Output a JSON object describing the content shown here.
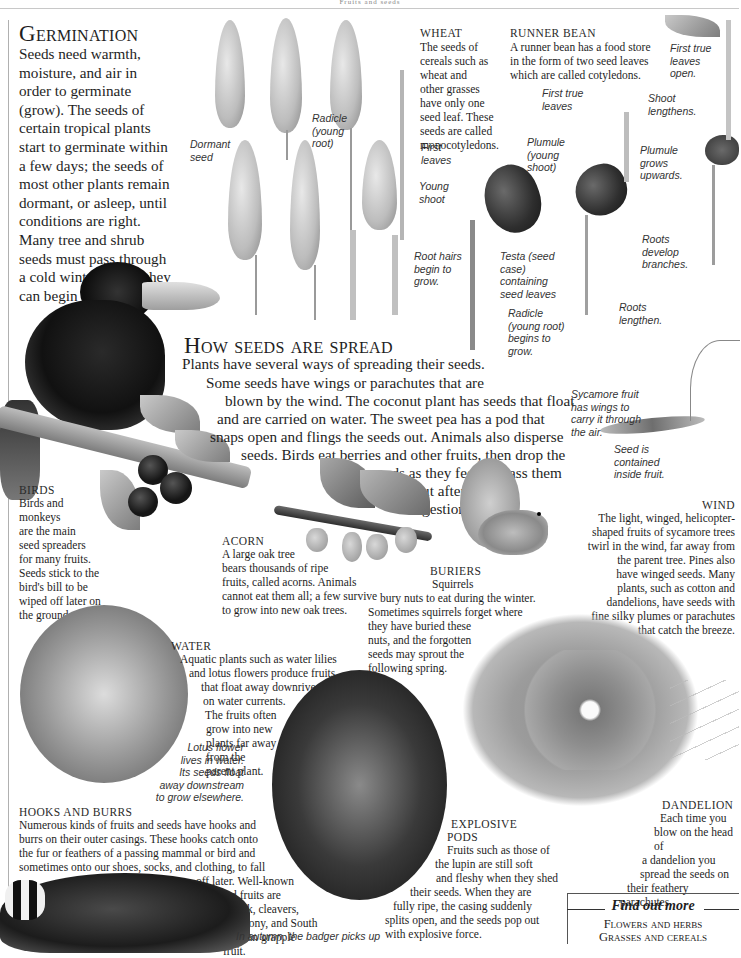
{
  "page": {
    "running_head": "Fruits and seeds"
  },
  "germination": {
    "heading": "Germination",
    "lines": [
      "Seeds need warmth,",
      "moisture, and air in",
      "order to germinate",
      "(grow). The seeds of",
      "certain tropical plants",
      "start to germinate within",
      "a few days; the seeds of",
      "most other plants remain",
      "dormant, or asleep, until",
      "conditions are right.",
      "Many tree and shrub",
      "seeds must pass through",
      "a cold winter before they",
      "can begin to grow."
    ]
  },
  "wheat": {
    "heading": "WHEAT",
    "lines": [
      "The seeds of",
      "cereals such as",
      "wheat and",
      "other grasses",
      "have only one",
      "seed leaf. These",
      "seeds are called",
      "monocotyledons."
    ],
    "labels": {
      "dormant_seed": [
        "Dormant",
        "seed"
      ],
      "radicle": [
        "Radicle",
        "(young",
        "root)"
      ],
      "first_leaves": [
        "First",
        "leaves"
      ],
      "young_shoot": [
        "Young",
        "shoot"
      ],
      "root_hairs": [
        "Root hairs",
        "begin to",
        "grow."
      ]
    }
  },
  "runner_bean": {
    "heading": "RUNNER BEAN",
    "lines": [
      "A runner bean has a food store",
      "in the form of two seed leaves",
      "which are called cotyledons."
    ],
    "labels": {
      "first_true_leaves_open": [
        "First true",
        "leaves",
        "open."
      ],
      "first_true_leaves": [
        "First true",
        "leaves"
      ],
      "shoot_lengthens": [
        "Shoot",
        "lengthens."
      ],
      "plumule": [
        "Plumule",
        "(young",
        "shoot)"
      ],
      "plumule_grows": [
        "Plumule",
        "grows",
        "upwards."
      ],
      "roots_develop": [
        "Roots",
        "develop",
        "branches."
      ],
      "testa": [
        "Testa (seed",
        "case)",
        "containing",
        "seed leaves"
      ],
      "radicle": [
        "Radicle",
        "(young root)",
        "begins to",
        "grow."
      ],
      "roots_lengthen": [
        "Roots",
        "lengthen."
      ]
    }
  },
  "how_spread": {
    "heading": "How seeds are spread",
    "lines": [
      "Plants have several ways of spreading their seeds.",
      "Some seeds have wings or parachutes that are",
      "blown by the wind. The coconut plant has seeds that float",
      "and are carried on water. The sweet pea has a pod that",
      "snaps open and flings the seeds out. Animals also disperse",
      "seeds. Birds eat berries and other fruits, then drop the",
      "seeds as they feed or pass them",
      "out after",
      "digestion."
    ]
  },
  "sycamore": {
    "caption": [
      "Sycamore fruit",
      "has wings to",
      "carry it through",
      "the air."
    ],
    "seed_caption": [
      "Seed is",
      "contained",
      "inside fruit."
    ]
  },
  "birds": {
    "heading": "BIRDS",
    "lines": [
      "Birds and",
      "monkeys",
      "are the main",
      "seed spreaders",
      "for many fruits.",
      "Seeds stick to the",
      "bird's bill to be",
      "wiped off later on",
      "the ground."
    ]
  },
  "acorn": {
    "heading": "ACORN",
    "lines": [
      "A large oak tree",
      "bears thousands of ripe",
      "fruits, called acorns. Animals",
      "cannot eat them all; a few survive",
      "to grow into new oak trees."
    ]
  },
  "buriers": {
    "heading": "BURIERS",
    "lines": [
      "Squirrels",
      "bury nuts to eat during the winter.",
      "Sometimes squirrels forget where",
      "they have buried these",
      "nuts, and the forgotten",
      "seeds may sprout the",
      "following spring."
    ]
  },
  "wind": {
    "heading": "WIND",
    "lines": [
      "The light, winged, helicopter-",
      "shaped fruits of sycamore trees",
      "twirl in the wind, far away from",
      "the parent tree. Pines also",
      "have winged seeds. Many",
      "plants, such as cotton and",
      "dandelions, have seeds with",
      "fine silky plumes or parachutes",
      "that catch the breeze."
    ]
  },
  "water": {
    "heading": "WATER",
    "lines": [
      "Aquatic plants such as water lilies",
      "and lotus flowers produce fruits",
      "that float away downriver",
      "on water currents.",
      "The fruits often",
      "grow into new",
      "plants far away",
      "from the",
      "parent plant."
    ],
    "caption": [
      "Lotus flower",
      "lives in water.",
      "Its seeds float",
      "away downstream",
      "to grow elsewhere."
    ]
  },
  "hooks": {
    "heading": "HOOKS AND BURRS",
    "lines": [
      "Numerous kinds of fruits and seeds have hooks and",
      "burrs on their outer casings. These hooks catch onto",
      "the fur or feathers of a passing mammal or bird and",
      "sometimes onto our shoes, socks, and clothing, to fall",
      "off later. Well-known",
      "hooked fruits are",
      "burdock, cleavers,",
      "agrimony, and South",
      "African grapple fruit."
    ],
    "badger_caption": "In autumn, the badger picks up"
  },
  "explosive": {
    "heading": [
      "EXPLOSIVE",
      "PODS"
    ],
    "lines": [
      "Fruits such as those of",
      "the lupin are still soft",
      "and fleshy when they shed",
      "their seeds. When they are",
      "fully ripe, the casing suddenly",
      "splits open, and the seeds pop out",
      "with explosive force."
    ]
  },
  "dandelion": {
    "heading": "DANDELION",
    "lines": [
      "Each time you",
      "blow on the head of",
      "a dandelion you",
      "spread the seeds on",
      "their feathery",
      "parachutes."
    ]
  },
  "find_out_more": {
    "title": "Find out more",
    "links": [
      "Flowers and herbs",
      "Grasses and cereals"
    ]
  }
}
